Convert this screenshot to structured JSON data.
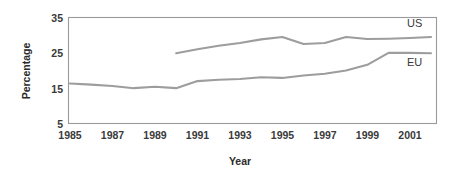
{
  "chart_data": {
    "type": "line",
    "title": "",
    "xlabel": "Year",
    "ylabel": "Percentage",
    "xlim": [
      1985,
      2002
    ],
    "ylim": [
      5,
      35
    ],
    "grid": false,
    "legend_position": "inline-right-of-line-end",
    "x_ticks": [
      "1985",
      "1987",
      "1989",
      "1991",
      "1993",
      "1995",
      "1997",
      "1999",
      "2001"
    ],
    "x_tick_values": [
      1985,
      1987,
      1989,
      1991,
      1993,
      1995,
      1997,
      1999,
      2001
    ],
    "y_ticks": [
      "5",
      "15",
      "25",
      "35"
    ],
    "y_tick_values": [
      5,
      15,
      25,
      35
    ],
    "series": [
      {
        "name": "US",
        "label": "US",
        "color": "#9d9d9d",
        "x": [
          1990,
          1991,
          1992,
          1993,
          1994,
          1995,
          1996,
          1997,
          1998,
          1999,
          2000,
          2001,
          2002
        ],
        "values": [
          24.9,
          26.0,
          27.0,
          27.8,
          28.8,
          29.5,
          27.5,
          27.8,
          29.5,
          28.9,
          29.0,
          29.2,
          29.5
        ]
      },
      {
        "name": "EU",
        "label": "EU",
        "color": "#9d9d9d",
        "x": [
          1985,
          1986,
          1987,
          1988,
          1989,
          1990,
          1991,
          1992,
          1993,
          1994,
          1995,
          1996,
          1997,
          1998,
          1999,
          2000,
          2001,
          2002
        ],
        "values": [
          16.3,
          16.0,
          15.6,
          15.0,
          15.4,
          15.0,
          17.0,
          17.4,
          17.6,
          18.1,
          17.9,
          18.6,
          19.1,
          20.0,
          21.6,
          25.0,
          25.0,
          24.9
        ]
      }
    ]
  },
  "axes": {
    "y_title": "Percentage",
    "x_title": "Year"
  },
  "series_labels": {
    "us": "US",
    "eu": "EU"
  },
  "colors": {
    "line": "#9d9d9d",
    "frame": "#9a9a9a",
    "text": "#2b2b2b",
    "background": "#ffffff"
  }
}
